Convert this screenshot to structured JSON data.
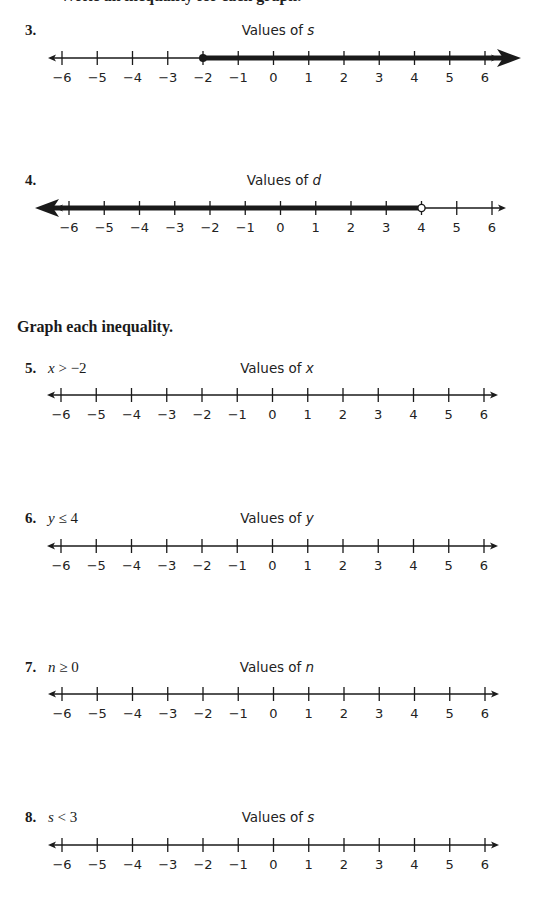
{
  "page": {
    "cutoff_text": "Write an inequality for each graph.",
    "section_heading": "Graph each inequality."
  },
  "problems": [
    {
      "number": "3.",
      "inequality": null,
      "title_prefix": "Values of ",
      "variable": "s",
      "ticks": [
        "−6",
        "−5",
        "−4",
        "−3",
        "−2",
        "−1",
        "0",
        "1",
        "2",
        "3",
        "4",
        "5",
        "6"
      ],
      "graph": {
        "point": -2,
        "point_type": "closed",
        "direction": "right"
      }
    },
    {
      "number": "4.",
      "inequality": null,
      "title_prefix": "Values of ",
      "variable": "d",
      "ticks": [
        "−6",
        "−5",
        "−4",
        "−3",
        "−2",
        "−1",
        "0",
        "1",
        "2",
        "3",
        "4",
        "5",
        "6"
      ],
      "graph": {
        "point": 4,
        "point_type": "open",
        "direction": "left"
      }
    },
    {
      "number": "5.",
      "inequality": {
        "var": "x",
        "op": " > ",
        "rhs": "−2"
      },
      "title_prefix": "Values of ",
      "variable": "x",
      "ticks": [
        "−6",
        "−5",
        "−4",
        "−3",
        "−2",
        "−1",
        "0",
        "1",
        "2",
        "3",
        "4",
        "5",
        "6"
      ],
      "graph": null
    },
    {
      "number": "6.",
      "inequality": {
        "var": "y",
        "op": " ≤ ",
        "rhs": "4"
      },
      "title_prefix": "Values of ",
      "variable": "y",
      "ticks": [
        "−6",
        "−5",
        "−4",
        "−3",
        "−2",
        "−1",
        "0",
        "1",
        "2",
        "3",
        "4",
        "5",
        "6"
      ],
      "graph": null
    },
    {
      "number": "7.",
      "inequality": {
        "var": "n",
        "op": " ≥ ",
        "rhs": "0"
      },
      "title_prefix": "Values of ",
      "variable": "n",
      "ticks": [
        "−6",
        "−5",
        "−4",
        "−3",
        "−2",
        "−1",
        "0",
        "1",
        "2",
        "3",
        "4",
        "5",
        "6"
      ],
      "graph": null
    },
    {
      "number": "8.",
      "inequality": {
        "var": "s",
        "op": " < ",
        "rhs": "3"
      },
      "title_prefix": "Values of ",
      "variable": "s",
      "ticks": [
        "−6",
        "−5",
        "−4",
        "−3",
        "−2",
        "−1",
        "0",
        "1",
        "2",
        "3",
        "4",
        "5",
        "6"
      ],
      "graph": null
    }
  ],
  "colors": {
    "ink": "#1a1a1a",
    "background": "#ffffff"
  }
}
